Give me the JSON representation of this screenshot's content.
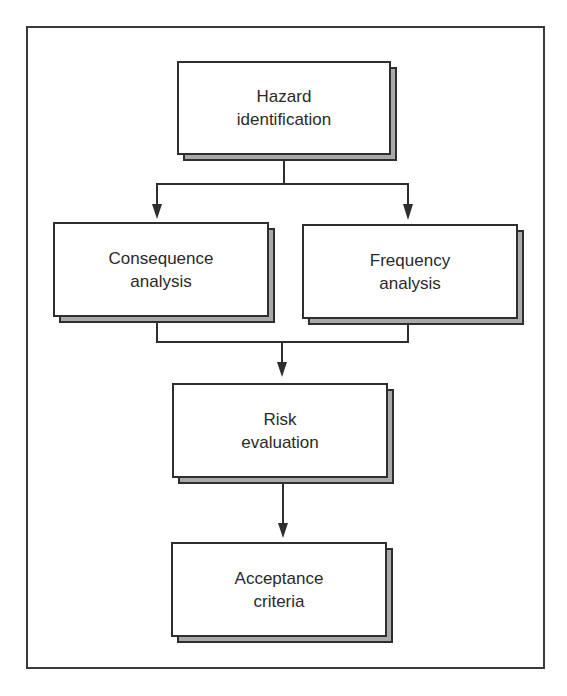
{
  "diagram": {
    "type": "flowchart",
    "title": "",
    "nodes": [
      {
        "id": "hazard",
        "line1": "Hazard",
        "line2": "identification"
      },
      {
        "id": "consequence",
        "line1": "Consequence",
        "line2": "analysis"
      },
      {
        "id": "frequency",
        "line1": "Frequency",
        "line2": "analysis"
      },
      {
        "id": "risk",
        "line1": "Risk",
        "line2": "evaluation"
      },
      {
        "id": "acceptance",
        "line1": "Acceptance",
        "line2": "criteria"
      }
    ],
    "edges": [
      {
        "from": "hazard",
        "to": "consequence"
      },
      {
        "from": "hazard",
        "to": "frequency"
      },
      {
        "from": "consequence",
        "to": "risk"
      },
      {
        "from": "frequency",
        "to": "risk"
      },
      {
        "from": "risk",
        "to": "acceptance"
      }
    ],
    "colors": {
      "line": "#2e2e2e",
      "shadow": "#a9a9a9",
      "box_fill": "#ffffff"
    }
  }
}
